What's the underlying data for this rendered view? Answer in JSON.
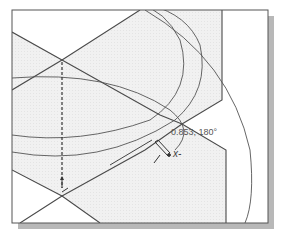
{
  "viewport": {
    "background": "#ffffff",
    "frame_color": "#555555",
    "shadow_color": "#b8b8b8",
    "region_fill": "#eeeeee",
    "line_color": "#444444"
  },
  "sketch": {
    "readout_text": "0.853, 180°",
    "cursor_snap_glyph": "x-",
    "cursor": "pencil-cursor"
  }
}
